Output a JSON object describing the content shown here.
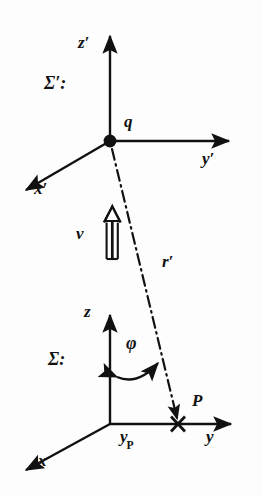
{
  "figure": {
    "background_color": "#fdfdfd",
    "ink_color": "#111111"
  },
  "labels": {
    "sigma_prime": "Σ′:",
    "z_prime": "z′",
    "y_prime": "y′",
    "x_prime": "x′",
    "charge": "q",
    "velocity": "v",
    "r_prime": "r′",
    "sigma": "Σ:",
    "z": "z",
    "y": "y",
    "x": "x",
    "phi": "φ",
    "point_p": "P",
    "y_p_base": "y",
    "y_p_sub": "P"
  },
  "geometry": {
    "frame_prime": {
      "origin": [
        110,
        141
      ],
      "z_axis_tip": [
        110,
        33
      ],
      "y_axis_tip": [
        232,
        141
      ],
      "x_axis_tip": [
        22,
        192
      ]
    },
    "frame_rest": {
      "origin": [
        110,
        424
      ],
      "z_axis_tip": [
        110,
        312
      ],
      "y_axis_tip": [
        234,
        424
      ],
      "x_axis_tip": [
        22,
        472
      ]
    },
    "r_prime_line": {
      "from": [
        110,
        141
      ],
      "to": [
        178,
        424
      ],
      "style": "dash-dot"
    },
    "point_p_marker": {
      "position": [
        178,
        424
      ],
      "marker": "x-cross"
    },
    "velocity_arrow": {
      "from": [
        112,
        258
      ],
      "to": [
        112,
        208
      ],
      "style": "hollow-double-shaft"
    },
    "phi_arc": {
      "from": [
        112,
        377
      ],
      "to": [
        163,
        362
      ],
      "style": "double-headed-curve"
    }
  },
  "icons": {
    "charge_dot": "filled-circle-icon",
    "p_cross": "cross-marker-icon",
    "velocity": "hollow-arrow-icon"
  }
}
